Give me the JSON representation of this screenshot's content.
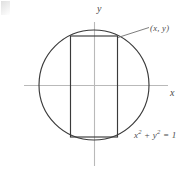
{
  "figure": {
    "kind": "geometry-diagram",
    "axes": {
      "x_label": "x",
      "y_label": "y",
      "origin": [
        94,
        85
      ],
      "x_axis_extent": [
        24,
        168
      ],
      "y_axis_extent": [
        22,
        166
      ],
      "color": "#b9b9b9"
    },
    "circle": {
      "center": [
        94,
        85
      ],
      "radius": 55,
      "equation_label": "x² + y² = 1",
      "equation_base": "x",
      "equation_exp1": "2",
      "equation_mid": " + y",
      "equation_exp2": "2",
      "equation_tail": " = 1",
      "color": "#3a3a3a"
    },
    "rectangle": {
      "left": 70.5,
      "right": 117.5,
      "top": 36,
      "bottom": 137,
      "color": "#3a3a3a",
      "inscribed": true
    },
    "point_label": {
      "text": "(x, y)",
      "leader_from": [
        118,
        37
      ],
      "leader_to": [
        149,
        27
      ]
    },
    "canvas": {
      "width": 193,
      "height": 175,
      "background": "#ffffff"
    }
  }
}
